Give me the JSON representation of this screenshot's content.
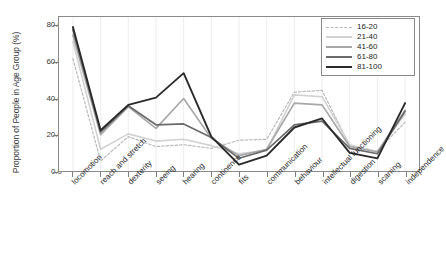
{
  "chart_data": {
    "type": "line",
    "title": "",
    "xlabel": "",
    "ylabel": "Proportion of People in Age Group (%)",
    "ylim": [
      0,
      85
    ],
    "yticks": [
      "0.0",
      "20.0",
      "40.0",
      "60.0",
      "80.0"
    ],
    "ytickvalues": [
      0,
      20,
      40,
      60,
      80
    ],
    "grid": "vertical",
    "legend_position": "top-right",
    "categories": [
      "locomotion",
      "reach and stretch",
      "dexterity",
      "seeing",
      "hearing",
      "continence",
      "fits",
      "communication",
      "behaviour",
      "intellectual functioning",
      "digestion",
      "scarring",
      "independence"
    ],
    "series": [
      {
        "name": "16-20",
        "color": "#b9b9b9",
        "style": "dashed",
        "width": 1.2,
        "values": [
          62.0,
          5.5,
          19.0,
          13.5,
          14.5,
          12.5,
          17.0,
          17.5,
          43.5,
          44.5,
          14.0,
          11.0,
          27.0
        ]
      },
      {
        "name": "21-40",
        "color": "#d2d2d2",
        "style": "solid",
        "width": 1.6,
        "values": [
          71.5,
          12.0,
          20.5,
          16.5,
          17.5,
          14.0,
          9.5,
          11.5,
          42.0,
          41.0,
          14.5,
          10.5,
          31.5
        ]
      },
      {
        "name": "41-60",
        "color": "#a8a8a8",
        "style": "solid",
        "width": 1.7,
        "values": [
          75.0,
          20.0,
          35.5,
          23.5,
          40.0,
          18.0,
          8.5,
          12.0,
          37.5,
          36.5,
          13.5,
          10.5,
          33.5
        ]
      },
      {
        "name": "61-80",
        "color": "#6b6b6b",
        "style": "solid",
        "width": 1.7,
        "values": [
          78.0,
          21.5,
          36.0,
          25.5,
          26.0,
          18.5,
          7.0,
          11.5,
          25.5,
          27.5,
          12.5,
          9.5,
          33.0
        ]
      },
      {
        "name": "81-100",
        "color": "#2a2a2a",
        "style": "solid",
        "width": 1.9,
        "values": [
          79.5,
          22.5,
          36.5,
          40.5,
          54.0,
          19.0,
          3.5,
          8.5,
          24.0,
          29.0,
          10.0,
          7.0,
          37.5
        ]
      }
    ]
  }
}
